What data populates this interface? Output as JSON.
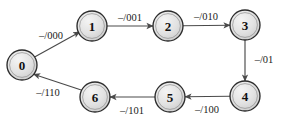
{
  "diagram": {
    "kind": "state-transition-diagram",
    "background_color": "#ffffff",
    "node_fill_color": "#e0e0e0",
    "node_stroke_color": "#2b2b2b",
    "edge_color": "#4a4a4a",
    "label_color": "#1a1a1a",
    "states": [
      {
        "id": "0",
        "label": "0",
        "cx": 22,
        "cy": 65,
        "r": 15
      },
      {
        "id": "1",
        "label": "1",
        "cx": 92,
        "cy": 26,
        "r": 15
      },
      {
        "id": "2",
        "label": "2",
        "cx": 168,
        "cy": 26,
        "r": 15
      },
      {
        "id": "3",
        "label": "3",
        "cx": 245,
        "cy": 25,
        "r": 15
      },
      {
        "id": "4",
        "label": "4",
        "cx": 245,
        "cy": 96,
        "r": 15
      },
      {
        "id": "5",
        "label": "5",
        "cx": 170,
        "cy": 97,
        "r": 15
      },
      {
        "id": "6",
        "label": "6",
        "cx": 95,
        "cy": 97,
        "r": 15
      }
    ],
    "transitions": [
      {
        "from": "0",
        "to": "1",
        "label": "–/000",
        "label_x": 51,
        "label_y": 35,
        "path": "M 34.6 57.0 L 79.8 31.9"
      },
      {
        "from": "1",
        "to": "2",
        "label": "–/001",
        "label_x": 130,
        "label_y": 17,
        "path": "M 107 26 L 153 26"
      },
      {
        "from": "2",
        "to": "3",
        "label": "–/010",
        "label_x": 206,
        "label_y": 16,
        "path": "M 183 25.8 L 230 25.2"
      },
      {
        "from": "3",
        "to": "4",
        "label": "–/01",
        "label_x": 264,
        "label_y": 59,
        "path": "M 245 40 L 245 81"
      },
      {
        "from": "4",
        "to": "5",
        "label": "–/100",
        "label_x": 207,
        "label_y": 109,
        "path": "M 230 96.3 L 185 96.8"
      },
      {
        "from": "5",
        "to": "6",
        "label": "–/101",
        "label_x": 132,
        "label_y": 110,
        "path": "M 155 97 L 110 97"
      },
      {
        "from": "6",
        "to": "0",
        "label": "–/110",
        "label_x": 48,
        "label_y": 92,
        "path": "M 82.0 90.3 L 33.6 74.2"
      }
    ]
  }
}
